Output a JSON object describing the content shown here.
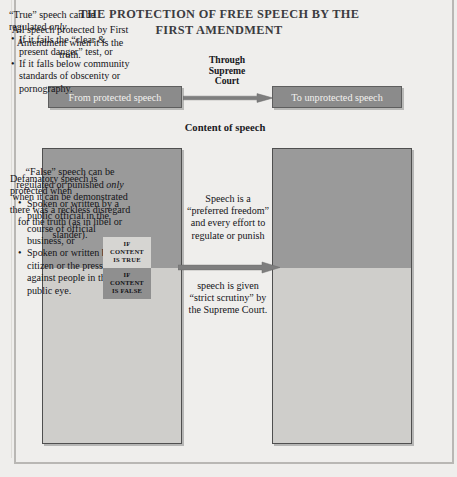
{
  "title": {
    "line1": "THE PROTECTION OF FREE SPEECH BY THE",
    "line2": "FIRST AMENDMENT"
  },
  "flow": {
    "from_label": "From protected speech",
    "to_label": "To unprotected speech",
    "through": {
      "line1": "Through",
      "line2": "Supreme",
      "line3": "Court"
    }
  },
  "content_label": "Content of speech",
  "left_panel": {
    "top_text": "All speech protected by First Amendment when it is the truth.",
    "stamp_true": {
      "line1": "IF",
      "line2": "CONTENT",
      "line3": "IS TRUE"
    },
    "stamp_false": {
      "line1": "IF",
      "line2": "CONTENT",
      "line3": "IS FALSE"
    },
    "bottom_lead": "Defamatory speech is protected when",
    "bottom_bullets": [
      "Spoken or written by a public official in the course of official business, or",
      "Spoken or written by a citizen or the press against people in the public eye."
    ]
  },
  "middle_column": {
    "top_text": "Speech is a “preferred freedom” and every effort to regulate or punish",
    "bottom_text": "speech is given “strict scrutiny” by the Supreme Court."
  },
  "right_panel": {
    "top_lead_before_em": "“True” speech can be regulated ",
    "top_lead_em": "only",
    "top_bullets": [
      "If it fails the “clear & present danger” test, or",
      "If it falls below community standards of obscenity or pornography."
    ],
    "bottom_before_em": "“False” speech can be regulated or punished ",
    "bottom_em": "only",
    "bottom_after_em": " when it can be demonstrated there was a reckless disregard for the truth (as in libel or slander)."
  },
  "colors": {
    "page_background": "#efeeec",
    "flow_box_fill": "#8b8b8b",
    "panel_dark": "#9a9a9a",
    "panel_light": "#cfcecb",
    "arrow": "#7e7e7e",
    "stamp_true_fill": "#d6d5d2",
    "stamp_false_fill": "#8f8f8f",
    "text": "#141418",
    "title_text": "#3b3b3f"
  }
}
